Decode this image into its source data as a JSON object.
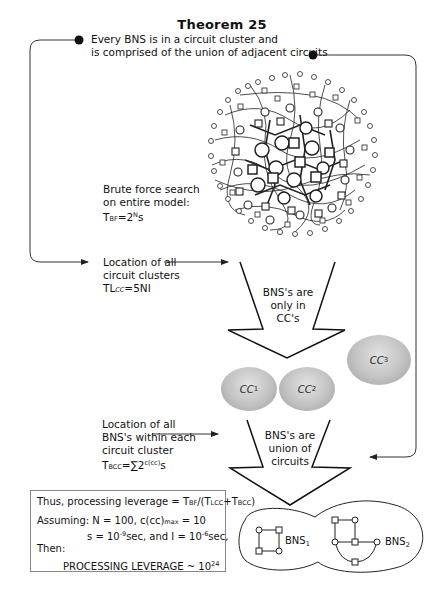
{
  "title": "Theorem 25",
  "theorem_statement": {
    "line1": "Every BNS is in a circuit cluster and",
    "line2": "is comprised of the union of adjacent circuits"
  },
  "brute_force": {
    "line1": "Brute force search",
    "line2": "on entire model:",
    "formula_T": "T",
    "formula_sub": "BF",
    "formula_eq": "=2",
    "formula_sup": "N",
    "formula_tail": "s"
  },
  "cluster_location": {
    "line1": "Location of all",
    "line2": "circuit clusters",
    "formula_T": "TL",
    "formula_sub": "CC",
    "formula_tail": "=5NI"
  },
  "arrow1_label": {
    "line1": "BNS's are",
    "line2": "only in",
    "line3": "CC's"
  },
  "clusters": [
    {
      "label": "CC",
      "sub": "1"
    },
    {
      "label": "CC",
      "sub": "2"
    },
    {
      "label": "CC",
      "sub": "3"
    }
  ],
  "bns_location": {
    "line1": "Location of all",
    "line2": "BNS's within each",
    "line3": "circuit cluster",
    "formula_T": "T",
    "formula_sub": "BCC",
    "formula_eq": "=∑2",
    "formula_sup": "c(cc)",
    "formula_tail": "s"
  },
  "arrow2_label": {
    "line1": "BNS's are",
    "line2": "union of",
    "line3": "circuits"
  },
  "result_box": {
    "leverage_prefix": "Thus, processing leverage = T",
    "leverage_sub1": "BF",
    "leverage_mid": "/(T",
    "leverage_sub2": "LCC",
    "leverage_plus": "+T",
    "leverage_sub3": "BCC",
    "leverage_close": ")",
    "assuming_prefix": "Assuming: N = 100, c(cc)",
    "assuming_sub": "max",
    "assuming_tail": " = 10",
    "s_prefix": "s = 10",
    "s_sup": "-9",
    "s_mid": "sec, and I = 10",
    "i_sup": "-6",
    "i_tail": "sec,",
    "then": "Then:",
    "result_prefix": "PROCESSING LEVERAGE ~ 10",
    "result_sup": "24"
  },
  "bns_examples": [
    {
      "label": "BNS",
      "sub": "1"
    },
    {
      "label": "BNS",
      "sub": "2"
    }
  ],
  "colors": {
    "line": "#333333",
    "cluster_fill": "#c2c2c2",
    "box_border": "#888888"
  }
}
